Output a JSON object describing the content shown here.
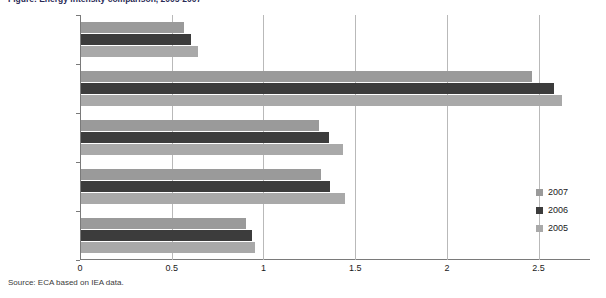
{
  "figure": {
    "title": "Figure: Energy intensity comparison, 2005-2007",
    "source_note": "Source: ECA based on IEA data."
  },
  "legend": {
    "position": "right",
    "entries": [
      {
        "label": "2007",
        "color": "#9a9a9a"
      },
      {
        "label": "2006",
        "color": "#3c3c3c"
      },
      {
        "label": "2005",
        "color": "#a9a9a9"
      }
    ]
  },
  "axis": {
    "x_ticks": [
      "0",
      "0.5",
      "1",
      "1.5",
      "2",
      "2.5"
    ],
    "y_categories": [
      "SSA-RSA",
      "South Africa",
      "North Africa",
      "Africa",
      "World"
    ]
  },
  "chart_data": {
    "type": "bar",
    "orientation": "horizontal",
    "title": "Figure: Energy intensity comparison, 2005-2007",
    "xlabel": "",
    "ylabel": "",
    "xlim": [
      0,
      2.78
    ],
    "grid": true,
    "legend_position": "right",
    "categories": [
      "SSA-RSA",
      "South Africa",
      "North Africa",
      "Africa",
      "World"
    ],
    "series": [
      {
        "name": "2007",
        "color": "#9a9a9a",
        "values": [
          0.56,
          2.46,
          1.3,
          1.31,
          0.9
        ]
      },
      {
        "name": "2006",
        "color": "#3c3c3c",
        "values": [
          0.6,
          2.58,
          1.35,
          1.36,
          0.93
        ]
      },
      {
        "name": "2005",
        "color": "#a9a9a9",
        "values": [
          0.64,
          2.62,
          1.43,
          1.44,
          0.95
        ]
      }
    ],
    "x_ticks": [
      0,
      0.5,
      1,
      1.5,
      2,
      2.5
    ],
    "source": "Source: ECA based on IEA data."
  }
}
